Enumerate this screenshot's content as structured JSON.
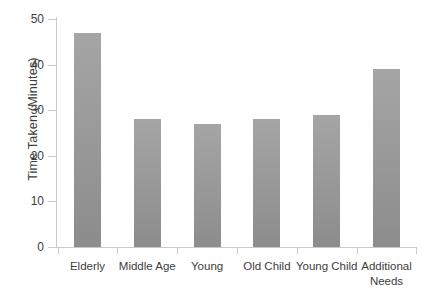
{
  "chart_data": {
    "type": "bar",
    "title": "",
    "xlabel": "",
    "ylabel": "Time Taken (Minutes)",
    "categories": [
      "Elderly",
      "Middle Age",
      "Young",
      "Old Child",
      "Young Child",
      "Additional Needs"
    ],
    "values": [
      47,
      28,
      27,
      28,
      29,
      39
    ],
    "ylim": [
      0,
      50
    ],
    "yticks": [
      0,
      10,
      20,
      30,
      40,
      50
    ],
    "ytick_labels": [
      "0",
      "10",
      "20",
      "30",
      "40",
      "50"
    ],
    "grid": false,
    "legend": null,
    "series": [
      {
        "name": "Time Taken",
        "values": [
          47,
          28,
          27,
          28,
          29,
          39
        ]
      }
    ],
    "colors": {
      "bar_fill_top": "#a5a5a5",
      "bar_fill_bottom": "#8c8c8c",
      "axis": "#c9c9c9",
      "text": "#3d3d3d",
      "background": "#ffffff"
    }
  }
}
